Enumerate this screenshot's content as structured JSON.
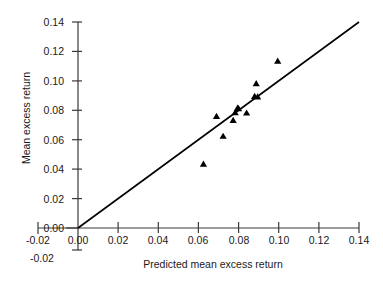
{
  "chart_data": {
    "type": "scatter",
    "title": "",
    "xlabel": "Predicted mean excess return",
    "ylabel": "Mean excess return",
    "xlim": [
      -0.02,
      0.14
    ],
    "ylim": [
      -0.02,
      0.14
    ],
    "xticks": [
      "-0.02",
      "0.00",
      "0.02",
      "0.04",
      "0.06",
      "0.08",
      "0.10",
      "0.12",
      "0.14"
    ],
    "xtick_values": [
      -0.02,
      0.0,
      0.02,
      0.04,
      0.06,
      0.08,
      0.1,
      0.12,
      0.14
    ],
    "yticks": [
      "-0.02",
      "0.00",
      "0.02",
      "0.04",
      "0.06",
      "0.08",
      "0.10",
      "0.12",
      "0.14"
    ],
    "ytick_values": [
      -0.02,
      0.0,
      0.02,
      0.04,
      0.06,
      0.08,
      0.1,
      0.12,
      0.14
    ],
    "grid": false,
    "legend": null,
    "marker": "triangle-up",
    "marker_color": "#000000",
    "line_color": "#000000",
    "points": [
      {
        "x": 0.0625,
        "y": 0.0433
      },
      {
        "x": 0.069,
        "y": 0.0757
      },
      {
        "x": 0.0723,
        "y": 0.0622
      },
      {
        "x": 0.0773,
        "y": 0.073
      },
      {
        "x": 0.0783,
        "y": 0.0783
      },
      {
        "x": 0.0795,
        "y": 0.0813
      },
      {
        "x": 0.08,
        "y": 0.081
      },
      {
        "x": 0.084,
        "y": 0.078
      },
      {
        "x": 0.088,
        "y": 0.0893
      },
      {
        "x": 0.0895,
        "y": 0.089
      },
      {
        "x": 0.0888,
        "y": 0.098
      },
      {
        "x": 0.0995,
        "y": 0.1132
      }
    ],
    "reference_line": {
      "name": "identity-45-degree",
      "x0": 0.0,
      "y0": 0.0,
      "x1": 0.14,
      "y1": 0.14
    }
  },
  "axes": {
    "y_title": "Mean excess return",
    "x_title": "Predicted mean excess return",
    "extra_negative_y_label": "-0.02"
  }
}
